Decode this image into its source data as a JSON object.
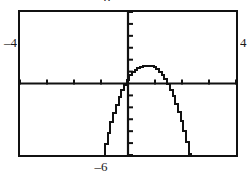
{
  "window": {
    "title": "Graphing calculator plot"
  },
  "labels": {
    "xmin": "–4",
    "xmax": "4",
    "ymin": "–6",
    "ymax": "6"
  },
  "chart_data": {
    "type": "line",
    "title": "",
    "subtitle": "",
    "xlabel": "",
    "ylabel": "",
    "grid": false,
    "legend": "none",
    "legend_entries": [],
    "annotations": [],
    "style": "graphing-calculator",
    "xlim": [
      -4,
      4
    ],
    "ylim": [
      -6,
      6
    ],
    "xtick_step": 1,
    "ytick_step": 1,
    "xticks": [
      -4,
      -3,
      -2,
      -1,
      0,
      1,
      2,
      3,
      4
    ],
    "yticks": [
      -6,
      -5,
      -4,
      -3,
      -2,
      -1,
      0,
      1,
      2,
      3,
      4,
      5,
      6
    ],
    "xtick_labels": [
      "–4",
      "",
      "",
      "",
      "",
      "",
      "",
      "",
      "4"
    ],
    "ytick_labels": [
      "–6",
      "",
      "",
      "",
      "",
      "",
      "",
      "",
      "",
      "",
      "",
      "",
      "6"
    ],
    "axis_origin": [
      0,
      0
    ],
    "series": [
      {
        "name": "parabola",
        "kind": "line",
        "color": "#111111",
        "width": 2,
        "roots": [
          -0.15,
          1.65
        ],
        "vertex": [
          0.75,
          1.5
        ],
        "x": [
          -0.95,
          -0.85,
          -0.75,
          -0.65,
          -0.55,
          -0.45,
          -0.35,
          -0.25,
          -0.15,
          -0.05,
          0.05,
          0.15,
          0.25,
          0.35,
          0.45,
          0.55,
          0.65,
          0.75,
          0.85,
          0.95,
          1.05,
          1.15,
          1.25,
          1.35,
          1.45,
          1.55,
          1.65,
          1.75,
          1.85,
          1.95,
          2.05,
          2.15,
          2.25,
          2.35,
          2.45,
          2.55
        ],
        "y": [
          -6.05,
          -5.05,
          -4.13,
          -3.27,
          -2.49,
          -1.78,
          -1.14,
          -0.58,
          -0.09,
          0.33,
          0.68,
          0.96,
          1.16,
          1.3,
          1.42,
          1.48,
          1.5,
          1.5,
          1.47,
          1.38,
          1.22,
          1.0,
          0.72,
          0.37,
          -0.05,
          -0.53,
          -1.09,
          -1.71,
          -2.4,
          -3.17,
          -4.0,
          -4.9,
          -5.88,
          -6.2,
          -6.5,
          -6.9
        ]
      }
    ]
  }
}
